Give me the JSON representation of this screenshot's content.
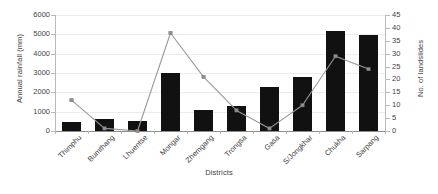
{
  "chart_data": {
    "type": "bar",
    "title": "",
    "xlabel": "Districts",
    "ylabel": "Annual rainfall (mm)",
    "y2label": "No. of landslides",
    "categories": [
      "Thimphu",
      "Bumthang",
      "Lhuentse",
      "Mongar",
      "Zhemgang",
      "Trongsa",
      "Gasa",
      "S/Jongkhar",
      "Chukha",
      "Sarpang"
    ],
    "ylim": [
      0,
      6000
    ],
    "y2lim": [
      0,
      45
    ],
    "yticks": [
      0,
      1000,
      2000,
      3000,
      4000,
      5000,
      6000
    ],
    "y2ticks": [
      0,
      5,
      10,
      15,
      20,
      25,
      30,
      35,
      40,
      45
    ],
    "grid": true,
    "legend": "none",
    "series": [
      {
        "name": "Annual rainfall (mm)",
        "type": "bar",
        "axis": "left",
        "color": "#111111",
        "values": [
          450,
          600,
          500,
          3000,
          1100,
          1300,
          2300,
          2800,
          5150,
          4950
        ]
      },
      {
        "name": "No. of landslides",
        "type": "line",
        "axis": "right",
        "color": "#9a9a9a",
        "values": [
          12,
          1,
          0,
          38,
          21,
          8,
          1,
          10,
          29,
          24
        ]
      }
    ]
  },
  "axis_titles": {
    "left": "Annual rainfall (mm)",
    "right": "No. of landslides",
    "bottom": "Districts"
  }
}
